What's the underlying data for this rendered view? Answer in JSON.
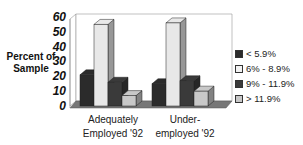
{
  "chart_data": {
    "type": "bar",
    "title": "",
    "xlabel": "",
    "ylabel": "Percent of Sample",
    "ylim": [
      0,
      60
    ],
    "yticks": [
      "60",
      "50",
      "40",
      "30",
      "20",
      "10",
      "0"
    ],
    "categories": [
      "Adequately Employed '92",
      "Under-employed '92"
    ],
    "series": [
      {
        "name": "< 5.9%",
        "color": "#2b2b2b",
        "values": [
          21,
          15
        ]
      },
      {
        "name": "6% - 8.9%",
        "color": "#e8e8e8",
        "values": [
          55,
          56
        ]
      },
      {
        "name": "9% - 11.9%",
        "color": "#3a3a3a",
        "values": [
          16,
          17
        ]
      },
      {
        "name": "> 11.9%",
        "color": "#c8c8c8",
        "values": [
          7,
          10
        ]
      }
    ],
    "legend_position": "right",
    "grid": false,
    "style": "3d"
  },
  "labels": {
    "ylabel_line1": "Percent of",
    "ylabel_line2": "Sample",
    "cat1_line1": "Adequately",
    "cat1_line2": "Employed '92",
    "cat2_line1": "Under-",
    "cat2_line2": "employed '92"
  }
}
